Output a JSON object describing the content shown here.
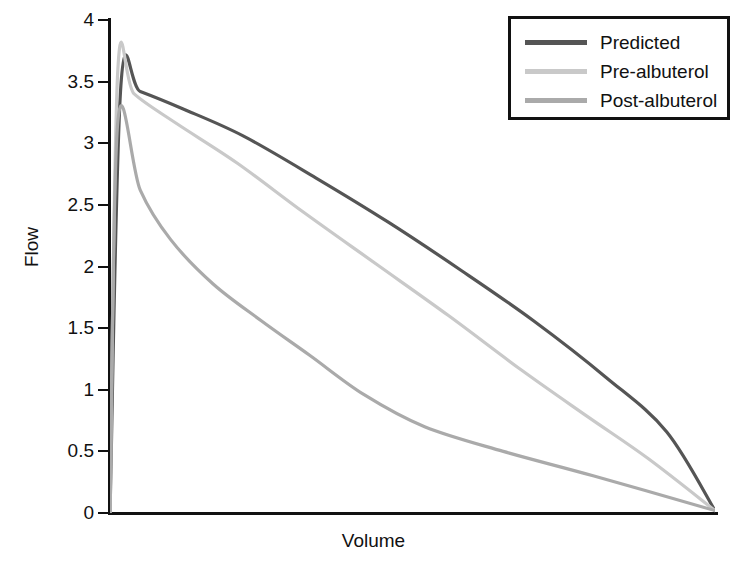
{
  "chart_data": {
    "type": "line",
    "title": "",
    "xlabel": "Volume",
    "ylabel": "Flow",
    "ylim": [
      0,
      4
    ],
    "yticks": [
      "0",
      "0.5",
      "1",
      "1.5",
      "2",
      "2.5",
      "3",
      "3.5",
      "4"
    ],
    "ytick_values": [
      0,
      0.5,
      1,
      1.5,
      2,
      2.5,
      3,
      3.5,
      4
    ],
    "xticks": [],
    "xlim": [
      0,
      1
    ],
    "grid": false,
    "legend_position": "top-right",
    "series": [
      {
        "name": "Predicted",
        "color": "#555555",
        "x": [
          0.0,
          0.018,
          0.05,
          0.12,
          0.22,
          0.34,
          0.46,
          0.58,
          0.7,
          0.82,
          0.92,
          1.0
        ],
        "y": [
          0.0,
          3.47,
          3.42,
          3.28,
          3.06,
          2.72,
          2.36,
          1.97,
          1.56,
          1.1,
          0.66,
          0.02
        ]
      },
      {
        "name": "Pre-albuterol",
        "color": "#c9c9c9",
        "x": [
          0.0,
          0.013,
          0.04,
          0.11,
          0.21,
          0.32,
          0.44,
          0.56,
          0.68,
          0.79,
          0.89,
          1.0
        ],
        "y": [
          0.0,
          3.6,
          3.4,
          3.16,
          2.84,
          2.44,
          2.02,
          1.6,
          1.16,
          0.78,
          0.44,
          0.02
        ]
      },
      {
        "name": "Post-albuterol",
        "color": "#aaaaaa",
        "x": [
          0.0,
          0.013,
          0.05,
          0.1,
          0.17,
          0.25,
          0.33,
          0.42,
          0.52,
          0.65,
          0.8,
          1.0
        ],
        "y": [
          0.0,
          3.18,
          2.62,
          2.22,
          1.86,
          1.56,
          1.28,
          0.96,
          0.7,
          0.5,
          0.3,
          0.02
        ]
      }
    ]
  },
  "axes": {
    "y_title": "Flow",
    "x_title": "Volume",
    "y_tick_labels": [
      "4",
      "3.5",
      "3",
      "2.5",
      "2",
      "1.5",
      "1",
      "0.5",
      "0"
    ]
  },
  "legend": {
    "items": [
      {
        "label": "Predicted",
        "color": "#555555"
      },
      {
        "label": "Pre-albuterol",
        "color": "#c9c9c9"
      },
      {
        "label": "Post-albuterol",
        "color": "#aaaaaa"
      }
    ]
  }
}
